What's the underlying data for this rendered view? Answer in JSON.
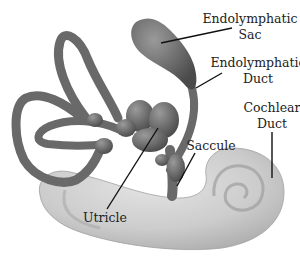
{
  "diagram": {
    "colors": {
      "background": "#ffffff",
      "labyrinth": "#6e6e6e",
      "labyrinth_dark": "#4f4f4f",
      "labyrinth_light": "#8a8a8a",
      "cochlea": "#cfcfcf",
      "cochlea_shade": "#b3b3b3",
      "label_text": "#222222",
      "leader_line": "#111111"
    },
    "labels": {
      "endolymphatic_sac": {
        "line1": "Endolymphatic",
        "line2": "Sac"
      },
      "endolymphatic_duct": {
        "line1": "Endolymphatic",
        "line2": "Duct"
      },
      "cochlear_duct": {
        "line1": "Cochlear",
        "line2": "Duct"
      },
      "saccule": {
        "line1": "Saccule"
      },
      "utricle": {
        "line1": "Utricle"
      }
    }
  }
}
